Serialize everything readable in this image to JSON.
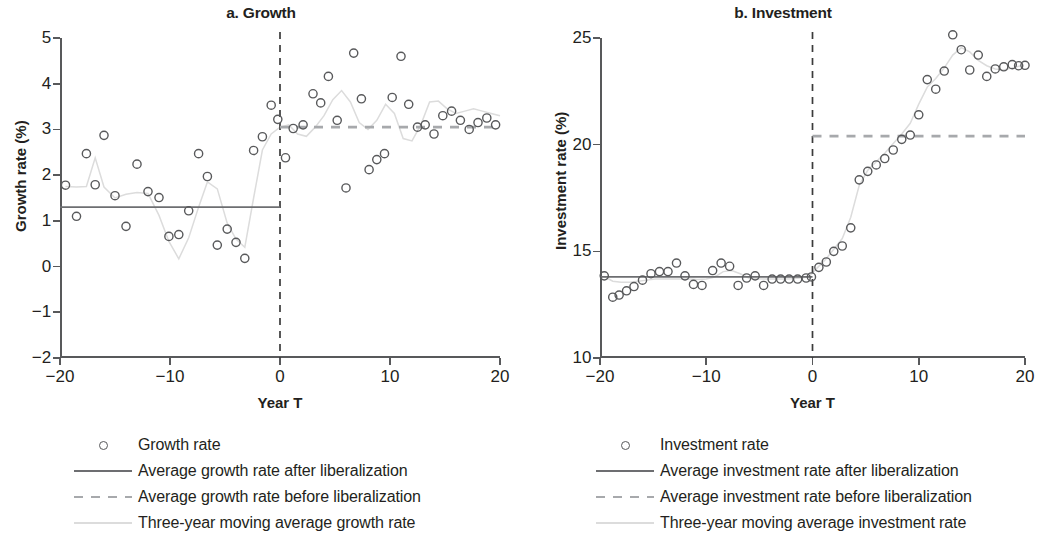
{
  "figure": {
    "panels": [
      {
        "id": "growth",
        "title": "a. Growth",
        "xlabel": "Year T",
        "ylabel": "Growth rate (%)",
        "legend": [
          {
            "key": "circle",
            "label": "Growth rate"
          },
          {
            "key": "solid",
            "label": "Average growth rate after liberalization"
          },
          {
            "key": "dashed",
            "label": "Average growth rate before liberalization"
          },
          {
            "key": "light",
            "label": "Three-year moving average growth rate"
          }
        ]
      },
      {
        "id": "investment",
        "title": "b. Investment",
        "xlabel": "Year T",
        "ylabel": "Investment rate (%)",
        "legend": [
          {
            "key": "circle",
            "label": "Investment rate"
          },
          {
            "key": "solid",
            "label": "Average investment rate after liberalization"
          },
          {
            "key": "dashed",
            "label": "Average investment rate before liberalization"
          },
          {
            "key": "light",
            "label": "Three-year moving average investment rate"
          }
        ]
      }
    ]
  },
  "chart_data": [
    {
      "type": "scatter",
      "id": "growth",
      "title": "a. Growth",
      "xlabel": "Year T",
      "ylabel": "Growth rate (%)",
      "xlim": [
        -20,
        20
      ],
      "ylim": [
        -2,
        5
      ],
      "xticks": [
        -20,
        -10,
        0,
        10,
        20
      ],
      "xticklabels": [
        "−20",
        "−10",
        "0",
        "10",
        "20"
      ],
      "yticks": [
        -2,
        -1,
        0,
        1,
        2,
        3,
        4,
        5
      ],
      "yticklabels": [
        "−2",
        "−1",
        "0",
        "1",
        "2",
        "3",
        "4",
        "5"
      ],
      "grid": false,
      "legend_position": "below",
      "annotations": [
        {
          "type": "vline",
          "x": 0,
          "style": "dashed",
          "label": "liberalization year"
        },
        {
          "type": "hline",
          "y": 1.3,
          "x_from": -20,
          "x_to": 0,
          "style": "solid",
          "label": "Average growth rate before liberalization"
        },
        {
          "type": "hline",
          "y": 3.05,
          "x_from": 0,
          "x_to": 20,
          "style": "dashed",
          "label": "Average growth rate after liberalization"
        }
      ],
      "series": [
        {
          "name": "Growth rate",
          "marker": "open-circle",
          "x": [
            -19.5,
            -18.5,
            -17.6,
            -16.8,
            -16.0,
            -15.0,
            -14.0,
            -13.0,
            -12.0,
            -11.0,
            -10.1,
            -9.2,
            -8.3,
            -7.4,
            -6.6,
            -5.7,
            -4.8,
            -4.0,
            -3.2,
            -2.4,
            -1.6,
            -0.8,
            -0.2,
            0.5,
            1.2,
            2.1,
            3.0,
            3.7,
            4.4,
            5.2,
            6.0,
            6.7,
            7.4,
            8.1,
            8.8,
            9.5,
            10.2,
            11.0,
            11.7,
            12.5,
            13.2,
            14.0,
            14.8,
            15.6,
            16.4,
            17.2,
            18.0,
            18.8,
            19.6
          ],
          "y": [
            1.78,
            1.1,
            2.47,
            1.79,
            2.87,
            1.55,
            0.88,
            2.24,
            1.64,
            1.51,
            0.66,
            0.7,
            1.22,
            2.47,
            1.97,
            0.47,
            0.82,
            0.53,
            0.18,
            2.54,
            2.84,
            3.53,
            3.22,
            2.38,
            3.02,
            3.1,
            3.78,
            3.58,
            4.16,
            3.2,
            1.72,
            4.67,
            3.67,
            2.12,
            2.34,
            2.47,
            3.7,
            4.6,
            3.55,
            3.05,
            3.1,
            2.9,
            3.3,
            3.4,
            3.2,
            3.0,
            3.15,
            3.25,
            3.1
          ]
        },
        {
          "name": "Three-year moving average growth rate",
          "marker": "none",
          "line": "light-solid",
          "x": [
            -19.5,
            -18.5,
            -17.6,
            -16.8,
            -16.0,
            -15.0,
            -14.0,
            -13.0,
            -12.0,
            -11.0,
            -10.1,
            -9.2,
            -8.3,
            -7.4,
            -6.6,
            -5.7,
            -4.8,
            -4.0,
            -3.2,
            -2.4,
            -1.6,
            -0.8,
            0.0,
            0.8,
            1.6,
            2.4,
            3.2,
            4.0,
            4.8,
            5.6,
            6.4,
            7.2,
            8.0,
            8.8,
            9.6,
            10.4,
            11.2,
            12.0,
            12.8,
            13.6,
            14.4,
            15.2,
            16.0,
            16.8,
            17.6,
            18.4,
            19.2,
            20.0
          ],
          "y": [
            1.75,
            1.74,
            1.75,
            2.38,
            1.74,
            1.5,
            1.58,
            1.62,
            1.6,
            1.12,
            0.55,
            0.17,
            0.63,
            1.3,
            1.85,
            1.7,
            0.95,
            0.6,
            0.42,
            1.5,
            2.55,
            2.9,
            3.05,
            3.1,
            2.9,
            2.85,
            3.05,
            3.3,
            3.65,
            3.85,
            3.6,
            3.15,
            3.0,
            3.2,
            3.55,
            3.35,
            2.8,
            2.75,
            3.1,
            3.6,
            3.62,
            3.45,
            3.35,
            3.4,
            3.45,
            3.4,
            3.35,
            3.3
          ]
        }
      ]
    },
    {
      "type": "scatter",
      "id": "investment",
      "title": "b. Investment",
      "xlabel": "Year T",
      "ylabel": "Investment rate (%)",
      "xlim": [
        -20,
        20
      ],
      "ylim": [
        10,
        25
      ],
      "xticks": [
        -20,
        -10,
        0,
        10,
        20
      ],
      "xticklabels": [
        "−20",
        "−10",
        "0",
        "10",
        "20"
      ],
      "yticks": [
        10,
        15,
        20,
        25
      ],
      "yticklabels": [
        "10",
        "15",
        "20",
        "25"
      ],
      "grid": false,
      "legend_position": "below",
      "annotations": [
        {
          "type": "vline",
          "x": 0,
          "style": "dashed",
          "label": "liberalization year"
        },
        {
          "type": "hline",
          "y": 13.8,
          "x_from": -20,
          "x_to": 0,
          "style": "solid",
          "label": "Average investment rate before liberalization"
        },
        {
          "type": "hline",
          "y": 20.4,
          "x_from": 0,
          "x_to": 20,
          "style": "dashed",
          "label": "Average investment rate after liberalization"
        }
      ],
      "series": [
        {
          "name": "Investment rate",
          "marker": "open-circle",
          "x": [
            -19.6,
            -18.8,
            -18.2,
            -17.5,
            -16.8,
            -16.0,
            -15.2,
            -14.4,
            -13.6,
            -12.8,
            -12.0,
            -11.2,
            -10.4,
            -9.4,
            -8.6,
            -7.8,
            -7.0,
            -6.2,
            -5.4,
            -4.6,
            -3.8,
            -3.0,
            -2.2,
            -1.4,
            -0.6,
            -0.1,
            0.6,
            1.3,
            2.0,
            2.8,
            3.6,
            4.4,
            5.2,
            6.0,
            6.8,
            7.6,
            8.4,
            9.2,
            10.0,
            10.8,
            11.6,
            12.4,
            13.2,
            14.0,
            14.8,
            15.6,
            16.4,
            17.2,
            18.0,
            18.8,
            19.4,
            20.0
          ],
          "y": [
            13.85,
            12.85,
            12.95,
            13.15,
            13.35,
            13.65,
            13.95,
            14.05,
            14.05,
            14.45,
            13.85,
            13.45,
            13.4,
            14.1,
            14.45,
            14.3,
            13.4,
            13.75,
            13.85,
            13.4,
            13.7,
            13.7,
            13.7,
            13.7,
            13.75,
            13.8,
            14.25,
            14.5,
            15.0,
            15.25,
            16.1,
            18.35,
            18.75,
            19.05,
            19.35,
            19.75,
            20.25,
            20.45,
            21.4,
            23.05,
            22.6,
            23.45,
            25.15,
            24.45,
            23.5,
            24.2,
            23.2,
            23.55,
            23.65,
            23.75,
            23.7,
            23.72
          ]
        },
        {
          "name": "Three-year moving average investment rate",
          "marker": "none",
          "line": "light-solid",
          "x": [
            -19.6,
            -18.8,
            -18.0,
            -17.2,
            -16.4,
            -15.6,
            -14.8,
            -14.0,
            -13.2,
            -12.4,
            -11.6,
            -10.8,
            -10.0,
            -9.2,
            -8.4,
            -7.6,
            -6.8,
            -6.0,
            -5.2,
            -4.4,
            -3.6,
            -2.8,
            -2.0,
            -1.2,
            -0.4,
            0.4,
            1.2,
            2.0,
            2.8,
            3.6,
            4.4,
            5.2,
            6.0,
            6.8,
            7.6,
            8.4,
            9.2,
            10.0,
            10.8,
            11.6,
            12.4,
            13.2,
            14.0,
            14.8,
            15.6,
            16.4,
            17.2,
            18.0,
            18.8,
            19.6
          ],
          "y": [
            13.82,
            13.6,
            13.55,
            13.55,
            13.6,
            13.65,
            13.7,
            13.7,
            13.7,
            13.7,
            13.7,
            13.68,
            13.7,
            13.8,
            14.05,
            14.1,
            13.95,
            13.75,
            13.72,
            13.7,
            13.7,
            13.7,
            13.72,
            13.75,
            13.8,
            14.2,
            14.6,
            15.1,
            15.6,
            16.6,
            18.1,
            18.8,
            19.2,
            19.6,
            20.05,
            20.5,
            21.0,
            21.9,
            22.7,
            23.1,
            23.6,
            24.2,
            24.55,
            24.35,
            23.95,
            23.7,
            23.55,
            23.5,
            23.6,
            23.7
          ]
        }
      ]
    }
  ]
}
